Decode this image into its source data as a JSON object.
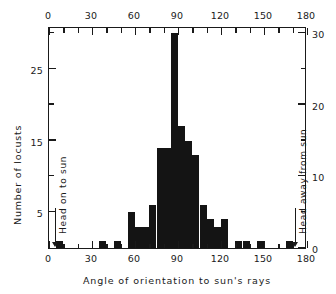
{
  "chart_data": {
    "type": "bar",
    "title": "",
    "xlabel": "Angle of orientation to sun's rays",
    "ylabel": "Number of locusts",
    "ylabel_right": "",
    "xlim": [
      0,
      180
    ],
    "ylim": [
      0,
      31
    ],
    "bin_width": 5,
    "grid": false,
    "legend": false,
    "x_ticks_major": [
      0,
      30,
      60,
      90,
      120,
      150,
      180
    ],
    "x_ticks_minor": [
      10,
      20,
      40,
      50,
      70,
      80,
      100,
      110,
      130,
      140,
      160,
      170
    ],
    "x_tick_labels_top": [
      "0",
      "30",
      "60",
      "90",
      "120",
      "150",
      "180"
    ],
    "x_tick_labels_bottom": [
      "0",
      "30",
      "60",
      "90",
      "120",
      "150",
      "180"
    ],
    "y_ticks_left_major": [
      5,
      15,
      25
    ],
    "y_ticks_left_minor": [
      10,
      20,
      30
    ],
    "y_tick_labels_left": [
      "5",
      "15",
      "25"
    ],
    "y_ticks_right_major": [
      0,
      10,
      20,
      30
    ],
    "y_ticks_right_minor": [
      5,
      15,
      25
    ],
    "y_tick_labels_right": [
      "0",
      "10",
      "20",
      "30"
    ],
    "annotations": [
      {
        "text": "Head on to sun",
        "x": 0,
        "arrow": "down"
      },
      {
        "text": "Head away from sun",
        "x": 180,
        "arrow": "down"
      }
    ],
    "bins": [
      {
        "x0": 0,
        "x1": 5,
        "value": 0
      },
      {
        "x0": 5,
        "x1": 10,
        "value": 1
      },
      {
        "x0": 10,
        "x1": 15,
        "value": 0
      },
      {
        "x0": 15,
        "x1": 20,
        "value": 0
      },
      {
        "x0": 20,
        "x1": 25,
        "value": 0
      },
      {
        "x0": 25,
        "x1": 30,
        "value": 0
      },
      {
        "x0": 30,
        "x1": 35,
        "value": 0
      },
      {
        "x0": 35,
        "x1": 40,
        "value": 1
      },
      {
        "x0": 40,
        "x1": 45,
        "value": 0
      },
      {
        "x0": 45,
        "x1": 50,
        "value": 1
      },
      {
        "x0": 50,
        "x1": 55,
        "value": 0
      },
      {
        "x0": 55,
        "x1": 60,
        "value": 5
      },
      {
        "x0": 60,
        "x1": 65,
        "value": 3
      },
      {
        "x0": 65,
        "x1": 70,
        "value": 3
      },
      {
        "x0": 70,
        "x1": 75,
        "value": 6
      },
      {
        "x0": 75,
        "x1": 80,
        "value": 14
      },
      {
        "x0": 80,
        "x1": 85,
        "value": 14
      },
      {
        "x0": 85,
        "x1": 90,
        "value": 30
      },
      {
        "x0": 90,
        "x1": 95,
        "value": 17
      },
      {
        "x0": 95,
        "x1": 100,
        "value": 15
      },
      {
        "x0": 100,
        "x1": 105,
        "value": 13
      },
      {
        "x0": 105,
        "x1": 110,
        "value": 6
      },
      {
        "x0": 110,
        "x1": 115,
        "value": 4
      },
      {
        "x0": 115,
        "x1": 120,
        "value": 3
      },
      {
        "x0": 120,
        "x1": 125,
        "value": 4
      },
      {
        "x0": 125,
        "x1": 130,
        "value": 0
      },
      {
        "x0": 130,
        "x1": 135,
        "value": 1
      },
      {
        "x0": 135,
        "x1": 140,
        "value": 1
      },
      {
        "x0": 140,
        "x1": 145,
        "value": 0
      },
      {
        "x0": 145,
        "x1": 150,
        "value": 1
      },
      {
        "x0": 150,
        "x1": 155,
        "value": 0
      },
      {
        "x0": 155,
        "x1": 160,
        "value": 0
      },
      {
        "x0": 160,
        "x1": 165,
        "value": 0
      },
      {
        "x0": 165,
        "x1": 170,
        "value": 1
      },
      {
        "x0": 170,
        "x1": 175,
        "value": 0
      },
      {
        "x0": 175,
        "x1": 180,
        "value": 0
      }
    ],
    "bar_color": "#141414",
    "axis_color": "#1a1a1a"
  }
}
